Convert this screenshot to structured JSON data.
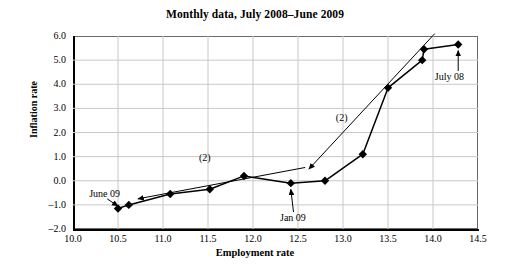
{
  "chart_data": {
    "type": "line",
    "title": "Monthly data, July 2008–June 2009",
    "xlabel": "Employment rate",
    "ylabel": "Inflation rate",
    "xlim": [
      10.0,
      14.5
    ],
    "ylim": [
      -2.0,
      6.0
    ],
    "xticks": [
      "10.0",
      "10.5",
      "11.0",
      "11.5",
      "12.0",
      "12.5",
      "13.0",
      "13.5",
      "14.0",
      "14.5"
    ],
    "yticks": [
      "6.0",
      "5.0",
      "4.0",
      "3.0",
      "2.0",
      "1.0",
      "0.0",
      "–1.0",
      "–2.0"
    ],
    "grid": true,
    "legend": "none",
    "marker": "filled-diamond",
    "line_color": "#000000",
    "grid_color": "#c8c8c8",
    "series": [
      {
        "name": "Monthly inflation vs employment",
        "points": [
          {
            "label": "June 09",
            "x": 10.5,
            "y": -1.15
          },
          {
            "label": "May 09",
            "x": 10.62,
            "y": -1.0
          },
          {
            "label": "Apr 09",
            "x": 11.08,
            "y": -0.55
          },
          {
            "label": "Mar 09",
            "x": 11.52,
            "y": -0.35
          },
          {
            "label": "Feb 09",
            "x": 11.9,
            "y": 0.2
          },
          {
            "label": "Jan 09",
            "x": 12.42,
            "y": -0.1
          },
          {
            "label": "Dec 08",
            "x": 12.8,
            "y": 0.0
          },
          {
            "label": "Nov 08",
            "x": 13.22,
            "y": 1.1
          },
          {
            "label": "Oct 08",
            "x": 13.5,
            "y": 3.85
          },
          {
            "label": "Sep 08",
            "x": 13.88,
            "y": 5.0
          },
          {
            "label": "Aug 08",
            "x": 13.9,
            "y": 5.45
          },
          {
            "label": "July 08",
            "x": 14.28,
            "y": 5.65
          }
        ]
      }
    ],
    "annotations": [
      {
        "name": "june-09-label",
        "text": "June 09",
        "x": 10.18,
        "y": -0.55
      },
      {
        "name": "jan-09-label",
        "text": "Jan 09",
        "x": 12.3,
        "y": -1.55
      },
      {
        "name": "july-08-label",
        "text": "July 08",
        "x": 14.02,
        "y": 4.3
      },
      {
        "name": "arrow-2-lower",
        "text": "(2)",
        "x": 11.4,
        "y": 0.95
      },
      {
        "name": "arrow-2-upper",
        "text": "(2)",
        "x": 12.92,
        "y": 2.6
      }
    ],
    "arrows": [
      {
        "name": "trend-arrow-lower",
        "from": {
          "x": 12.58,
          "y": 0.55
        },
        "to": {
          "x": 10.72,
          "y": -0.75
        }
      },
      {
        "name": "trend-arrow-upper",
        "from": {
          "x": 14.02,
          "y": 6.1
        },
        "to": {
          "x": 12.62,
          "y": 0.48
        }
      },
      {
        "name": "callout-june-09",
        "from": {
          "x": 10.38,
          "y": -0.75
        },
        "to": {
          "x": 10.5,
          "y": -1.05
        }
      },
      {
        "name": "callout-jan-09",
        "from": {
          "x": 12.45,
          "y": -1.3
        },
        "to": {
          "x": 12.42,
          "y": -0.35
        }
      },
      {
        "name": "callout-july-08",
        "from": {
          "x": 14.28,
          "y": 4.55
        },
        "to": {
          "x": 14.28,
          "y": 5.4
        }
      }
    ]
  }
}
